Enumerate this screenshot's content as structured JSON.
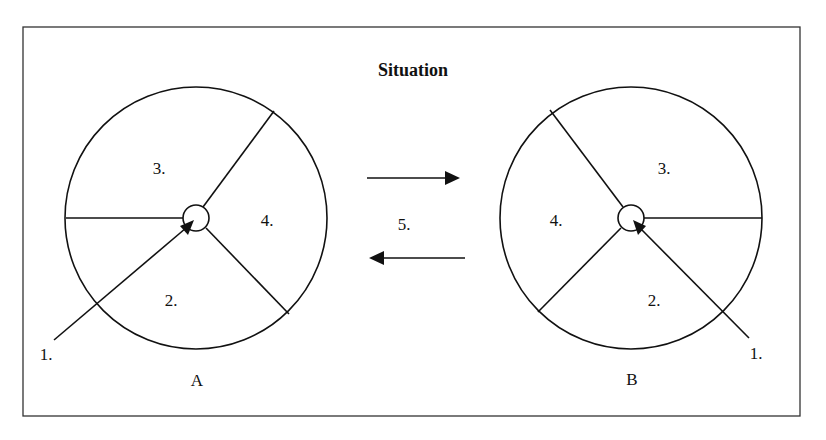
{
  "title": "Situation",
  "wheel_a": {
    "name": "A",
    "labels": {
      "seg3": "3.",
      "seg4": "4.",
      "seg2": "2.",
      "pointer": "1."
    }
  },
  "wheel_b": {
    "name": "B",
    "labels": {
      "seg3": "3.",
      "seg4": "4.",
      "seg2": "2.",
      "pointer": "1."
    }
  },
  "transition": {
    "label": "5.",
    "arrow_right": "right-arrow",
    "arrow_left": "left-arrow"
  }
}
